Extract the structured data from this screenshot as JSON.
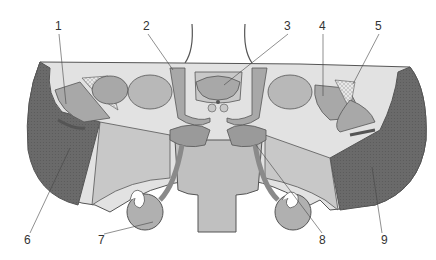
{
  "diagram": {
    "type": "anatomical cross-section",
    "colors": {
      "background": "#ffffff",
      "outline": "#555555",
      "light_fill": "#e2e2e2",
      "mid_fill": "#bdbdbd",
      "dark_fill": "#9a9a9a",
      "textured_dark": "#6a6a6a",
      "label_text": "#333333"
    },
    "labels": [
      {
        "id": "1",
        "text": "1",
        "x": 55,
        "y": 30
      },
      {
        "id": "2",
        "text": "2",
        "x": 143,
        "y": 30
      },
      {
        "id": "3",
        "text": "3",
        "x": 284,
        "y": 30
      },
      {
        "id": "4",
        "text": "4",
        "x": 319,
        "y": 30
      },
      {
        "id": "5",
        "text": "5",
        "x": 375,
        "y": 30
      },
      {
        "id": "6",
        "text": "6",
        "x": 24,
        "y": 241
      },
      {
        "id": "7",
        "text": "7",
        "x": 98,
        "y": 241
      },
      {
        "id": "8",
        "text": "8",
        "x": 319,
        "y": 241
      },
      {
        "id": "9",
        "text": "9",
        "x": 381,
        "y": 241
      }
    ]
  }
}
